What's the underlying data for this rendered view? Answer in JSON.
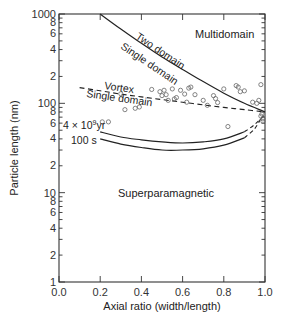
{
  "chart_data": {
    "type": "line",
    "title": "",
    "xlabel": "Axial ratio (width/length)",
    "ylabel": "Particle length (nm)",
    "xlim": [
      0.0,
      1.0
    ],
    "ylim": [
      1,
      1000
    ],
    "yscale": "log",
    "x_ticks": [
      "0.0",
      "0.2",
      "0.4",
      "0.6",
      "0.8",
      "1.0"
    ],
    "y_ticks": [
      {
        "value": 1,
        "label": "1"
      },
      {
        "value": 2,
        "label": "2"
      },
      {
        "value": 4,
        "label": "4"
      },
      {
        "value": 6,
        "label": "6"
      },
      {
        "value": 8,
        "label": "8"
      },
      {
        "value": 10,
        "label": "10"
      },
      {
        "value": 20,
        "label": "2"
      },
      {
        "value": 40,
        "label": "4"
      },
      {
        "value": 60,
        "label": "6"
      },
      {
        "value": 80,
        "label": "8"
      },
      {
        "value": 100,
        "label": "100"
      },
      {
        "value": 200,
        "label": "2"
      },
      {
        "value": 400,
        "label": "4"
      },
      {
        "value": 600,
        "label": "6"
      },
      {
        "value": 800,
        "label": "8"
      },
      {
        "value": 1000,
        "label": "1000"
      }
    ],
    "grid": false,
    "regions": [
      {
        "label": "Multidomain",
        "x": 0.82,
        "y": 700
      },
      {
        "label": "Superparamagnetic",
        "x": 0.62,
        "y": 8
      }
    ],
    "series": [
      {
        "name": "Two domain / Single domain boundary",
        "style": "solid",
        "labels": [
          "Two domain",
          "Single domain"
        ],
        "x": [
          0.2,
          0.3,
          0.4,
          0.5,
          0.6,
          0.7,
          0.8,
          0.9,
          1.0
        ],
        "y": [
          1000,
          680,
          470,
          330,
          240,
          175,
          130,
          100,
          80
        ]
      },
      {
        "name": "Vortex / Single domain boundary",
        "style": "dashed",
        "labels": [
          "Vortex",
          "Single domain"
        ],
        "x": [
          0.1,
          0.2,
          0.3,
          0.4,
          0.5,
          0.6,
          0.7,
          0.8,
          0.9,
          1.0
        ],
        "y": [
          150,
          138,
          127,
          118,
          110,
          103,
          96,
          90,
          85,
          80
        ]
      },
      {
        "name": "4 x 10^9 yr",
        "style": "solid-then-dashed",
        "label": "4 × 10⁹yr",
        "x": [
          0.2,
          0.3,
          0.4,
          0.5,
          0.6,
          0.7,
          0.8,
          0.9,
          0.95,
          1.0
        ],
        "y": [
          48,
          42,
          39,
          37,
          36,
          37,
          40,
          48,
          58,
          75
        ]
      },
      {
        "name": "100 s",
        "style": "solid-then-dashed",
        "label": "100 s",
        "x": [
          0.2,
          0.3,
          0.4,
          0.5,
          0.6,
          0.7,
          0.8,
          0.9,
          0.95,
          0.98
        ],
        "y": [
          40,
          35,
          32,
          30,
          30,
          31,
          34,
          41,
          52,
          68
        ]
      },
      {
        "name": "Measured particles",
        "style": "open-circles",
        "points": [
          [
            0.21,
            62
          ],
          [
            0.24,
            62
          ],
          [
            0.3,
            128
          ],
          [
            0.32,
            85
          ],
          [
            0.37,
            88
          ],
          [
            0.39,
            91
          ],
          [
            0.45,
            143
          ],
          [
            0.49,
            135
          ],
          [
            0.5,
            122
          ],
          [
            0.51,
            140
          ],
          [
            0.52,
            125
          ],
          [
            0.53,
            108
          ],
          [
            0.55,
            145
          ],
          [
            0.56,
            112
          ],
          [
            0.57,
            116
          ],
          [
            0.59,
            140
          ],
          [
            0.61,
            127
          ],
          [
            0.62,
            103
          ],
          [
            0.63,
            148
          ],
          [
            0.64,
            152
          ],
          [
            0.66,
            125
          ],
          [
            0.7,
            108
          ],
          [
            0.72,
            95
          ],
          [
            0.75,
            122
          ],
          [
            0.76,
            113
          ],
          [
            0.77,
            102
          ],
          [
            0.8,
            145
          ],
          [
            0.82,
            55
          ],
          [
            0.86,
            158
          ],
          [
            0.87,
            152
          ],
          [
            0.88,
            135
          ],
          [
            0.9,
            138
          ],
          [
            0.94,
            103
          ],
          [
            0.96,
            100
          ],
          [
            0.97,
            108
          ],
          [
            0.98,
            162
          ],
          [
            0.98,
            72
          ],
          [
            0.99,
            67
          ],
          [
            0.99,
            63
          ],
          [
            0.985,
            76
          ]
        ]
      }
    ]
  },
  "labels": {
    "multidomain": "Multidomain",
    "superparamagnetic": "Superparamagnetic",
    "two_domain": "Two domain",
    "single_domain_upper": "Single domain",
    "vortex": "Vortex",
    "single_domain_lower": "Single domain",
    "curve_4e9": "4 × 10",
    "curve_4e9_exp": "9",
    "curve_4e9_unit": "yr",
    "curve_100s": "100 s",
    "xlabel": "Axial ratio (width/length)",
    "ylabel": "Particle length (nm)"
  }
}
